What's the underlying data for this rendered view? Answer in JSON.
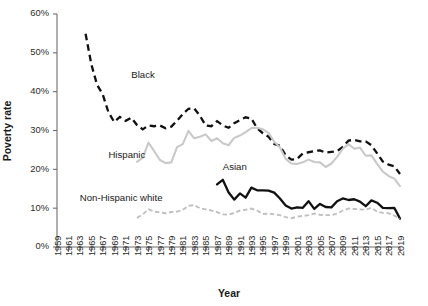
{
  "chart_data": {
    "type": "line",
    "title": "",
    "xlabel": "Year",
    "ylabel": "Poverty rate",
    "xlim": [
      1959,
      2019
    ],
    "ylim": [
      0,
      60
    ],
    "grid": false,
    "legend_position": "inline-annotations",
    "ytick_labels": [
      "0%",
      "10%",
      "20%",
      "30%",
      "40%",
      "50%",
      "60%"
    ],
    "ytick_values": [
      0,
      10,
      20,
      30,
      40,
      50,
      60
    ],
    "xtick_labels": [
      "1959",
      "1961",
      "1963",
      "1965",
      "1967",
      "1969",
      "1971",
      "1973",
      "1975",
      "1977",
      "1979",
      "1981",
      "1983",
      "1985",
      "1987",
      "1989",
      "1991",
      "1993",
      "1995",
      "1997",
      "1999",
      "2001",
      "2003",
      "2005",
      "2007",
      "2009",
      "2011",
      "2013",
      "2015",
      "2017",
      "2019"
    ],
    "xtick_values": [
      1959,
      1961,
      1963,
      1965,
      1967,
      1969,
      1971,
      1973,
      1975,
      1977,
      1979,
      1981,
      1983,
      1985,
      1987,
      1989,
      1991,
      1993,
      1995,
      1997,
      1999,
      2001,
      2003,
      2005,
      2007,
      2009,
      2011,
      2013,
      2015,
      2017,
      2019
    ],
    "series": [
      {
        "name": "Black",
        "label": "Black",
        "color": "#111111",
        "style": "dashed-thick",
        "label_x": 1972,
        "label_y": 43.5,
        "x": [
          1964,
          1965,
          1966,
          1967,
          1968,
          1969,
          1970,
          1971,
          1972,
          1973,
          1974,
          1975,
          1976,
          1977,
          1978,
          1979,
          1980,
          1981,
          1982,
          1983,
          1984,
          1985,
          1986,
          1987,
          1988,
          1989,
          1990,
          1991,
          1992,
          1993,
          1994,
          1995,
          1996,
          1997,
          1998,
          1999,
          2000,
          2001,
          2002,
          2003,
          2004,
          2005,
          2006,
          2007,
          2008,
          2009,
          2010,
          2011,
          2012,
          2013,
          2014,
          2015,
          2016,
          2017,
          2018,
          2019
        ],
        "y": [
          54.9,
          47.1,
          41.8,
          39.3,
          34.7,
          32.2,
          33.5,
          32.5,
          33.3,
          31.4,
          30.3,
          31.3,
          31.1,
          31.3,
          30.6,
          31.0,
          32.5,
          34.2,
          35.6,
          35.7,
          33.8,
          31.3,
          31.1,
          32.4,
          31.3,
          30.7,
          31.9,
          32.7,
          33.4,
          33.1,
          30.6,
          29.3,
          28.4,
          26.5,
          26.1,
          23.6,
          22.5,
          22.7,
          24.1,
          24.4,
          24.7,
          24.9,
          24.3,
          24.5,
          24.7,
          25.8,
          27.4,
          27.6,
          27.2,
          27.2,
          26.2,
          24.1,
          22.0,
          21.2,
          20.8,
          18.8
        ]
      },
      {
        "name": "Hispanic",
        "label": "Hispanic",
        "color": "#c9c9c9",
        "style": "solid-light",
        "label_x": 1968,
        "label_y": 23.0,
        "x": [
          1973,
          1974,
          1975,
          1976,
          1977,
          1978,
          1979,
          1980,
          1981,
          1982,
          1983,
          1984,
          1985,
          1986,
          1987,
          1988,
          1989,
          1990,
          1991,
          1992,
          1993,
          1994,
          1995,
          1996,
          1997,
          1998,
          1999,
          2000,
          2001,
          2002,
          2003,
          2004,
          2005,
          2006,
          2007,
          2008,
          2009,
          2010,
          2011,
          2012,
          2013,
          2014,
          2015,
          2016,
          2017,
          2018,
          2019
        ],
        "y": [
          21.9,
          23.0,
          26.9,
          24.7,
          22.4,
          21.6,
          21.8,
          25.7,
          26.5,
          29.9,
          28.0,
          28.4,
          29.0,
          27.3,
          28.0,
          26.7,
          26.2,
          28.1,
          28.7,
          29.6,
          30.6,
          30.7,
          30.3,
          29.4,
          27.1,
          25.6,
          22.7,
          21.5,
          21.4,
          21.8,
          22.5,
          21.9,
          21.8,
          20.6,
          21.5,
          23.2,
          25.3,
          26.5,
          25.3,
          25.6,
          23.5,
          23.6,
          21.4,
          19.4,
          18.3,
          17.6,
          15.7
        ]
      },
      {
        "name": "Asian",
        "label": "Asian",
        "color": "#111111",
        "style": "solid-thick",
        "label_x": 1988,
        "label_y": 19.7,
        "x": [
          1987,
          1988,
          1989,
          1990,
          1991,
          1992,
          1993,
          1994,
          1995,
          1996,
          1997,
          1998,
          1999,
          2000,
          2001,
          2002,
          2003,
          2004,
          2005,
          2006,
          2007,
          2008,
          2009,
          2010,
          2011,
          2012,
          2013,
          2014,
          2015,
          2016,
          2017,
          2018,
          2019
        ],
        "y": [
          16.1,
          17.3,
          14.1,
          12.2,
          13.8,
          12.7,
          15.3,
          14.6,
          14.6,
          14.5,
          14.0,
          12.5,
          10.7,
          9.9,
          10.2,
          10.1,
          11.8,
          9.8,
          11.1,
          10.3,
          10.2,
          11.8,
          12.5,
          12.1,
          12.3,
          11.7,
          10.5,
          12.0,
          11.4,
          10.1,
          10.0,
          10.1,
          7.3
        ]
      },
      {
        "name": "Non-Hispanic white",
        "label": "Non-Hispanic white",
        "color": "#c0c0c0",
        "style": "dashed-light",
        "label_x": 1963,
        "label_y": 11.9,
        "x": [
          1973,
          1974,
          1975,
          1976,
          1977,
          1978,
          1979,
          1980,
          1981,
          1982,
          1983,
          1984,
          1985,
          1986,
          1987,
          1988,
          1989,
          1990,
          1991,
          1992,
          1993,
          1994,
          1995,
          1996,
          1997,
          1998,
          1999,
          2000,
          2001,
          2002,
          2003,
          2004,
          2005,
          2006,
          2007,
          2008,
          2009,
          2010,
          2011,
          2012,
          2013,
          2014,
          2015,
          2016,
          2017,
          2018,
          2019
        ],
        "y": [
          7.5,
          8.4,
          9.7,
          9.1,
          8.9,
          8.7,
          9.0,
          9.1,
          9.6,
          10.6,
          10.8,
          10.0,
          9.7,
          9.4,
          9.0,
          8.4,
          8.3,
          8.8,
          9.4,
          9.6,
          9.9,
          9.4,
          8.5,
          8.6,
          8.4,
          8.2,
          7.7,
          7.4,
          7.8,
          8.0,
          8.2,
          8.6,
          8.3,
          8.2,
          8.2,
          8.6,
          9.4,
          9.9,
          9.8,
          9.7,
          9.6,
          10.1,
          9.1,
          8.8,
          8.7,
          8.1,
          7.3
        ]
      }
    ]
  }
}
